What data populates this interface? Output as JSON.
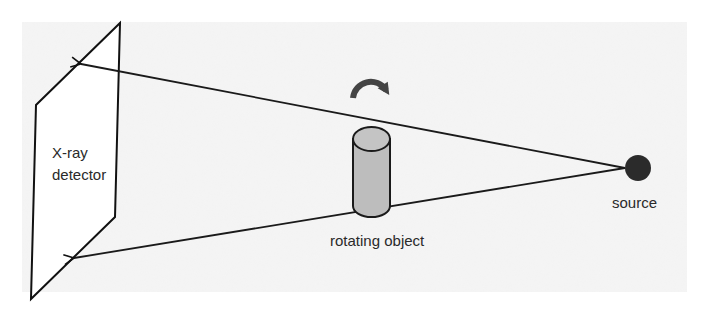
{
  "diagram": {
    "type": "ct-scan-geometry",
    "background_panel": {
      "color": "#f2f2f2"
    },
    "detector": {
      "label_line1": "X-ray",
      "label_line2": "detector",
      "stroke": "#111111"
    },
    "object": {
      "label": "rotating object",
      "fill": "#bdbdbd",
      "stroke": "#1a1a1a",
      "rotation_icon": "curved-arrow-clockwise",
      "rotation_color": "#444444"
    },
    "source": {
      "label": "source",
      "fill": "#2b2b2b"
    },
    "beams": [
      {
        "name": "upper-beam",
        "from": "source",
        "to": "detector-upper"
      },
      {
        "name": "lower-beam",
        "from": "source",
        "to": "detector-lower"
      }
    ]
  }
}
